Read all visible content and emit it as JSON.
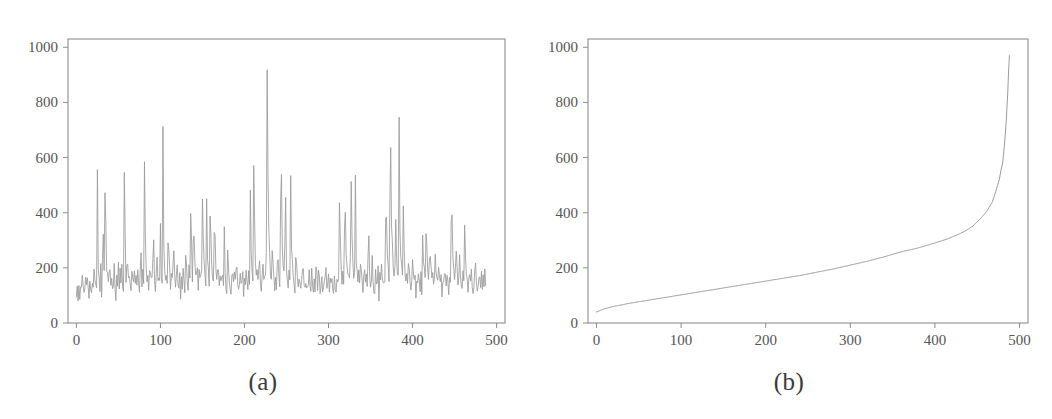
{
  "figure": {
    "background_color": "#ffffff",
    "line_color": "#9a9a9a",
    "axis_color": "#8e8e8e",
    "tick_label_color": "#555555",
    "caption_color": "#3a3a3a"
  },
  "panels": [
    {
      "id": "a",
      "caption": "(a)"
    },
    {
      "id": "b",
      "caption": "(b)"
    }
  ],
  "chart_data": [
    {
      "type": "line",
      "panel": "(a)",
      "title": "",
      "xlabel": "",
      "ylabel": "",
      "xlim": [
        -10,
        510
      ],
      "ylim": [
        0,
        1030
      ],
      "xticks": [
        0,
        100,
        200,
        300,
        400,
        500
      ],
      "yticks": [
        0,
        200,
        400,
        600,
        800,
        1000
      ],
      "xtick_labels": [
        "0",
        "100",
        "200",
        "300",
        "400",
        "500"
      ],
      "ytick_labels": [
        "0",
        "200",
        "400",
        "600",
        "800",
        "1000"
      ],
      "grid": false,
      "legend": null,
      "series": [
        {
          "name": "value",
          "note": "unsorted sequence of 488 positive values, noisy baseline near 150-200 with sharp spikes up to ~980",
          "x_start": 0,
          "x_end": 487,
          "values": [
            95,
            112,
            78,
            130,
            88,
            155,
            104,
            168,
            120,
            72,
            140,
            160,
            108,
            185,
            96,
            132,
            150,
            88,
            176,
            112,
            200,
            128,
            158,
            98,
            565,
            190,
            142,
            118,
            205,
            86,
            246,
            322,
            160,
            624,
            214,
            130,
            188,
            102,
            262,
            146,
            178,
            120,
            96,
            210,
            158,
            84,
            170,
            136,
            222,
            108,
            182,
            152,
            240,
            118,
            96,
            676,
            204,
            144,
            268,
            172,
            130,
            210,
            88,
            156,
            196,
            122,
            248,
            102,
            178,
            134,
            214,
            160,
            92,
            188,
            242,
            118,
            206,
            150,
            668,
            232,
            176,
            128,
            196,
            108,
            268,
            154,
            188,
            126,
            364,
            212,
            96,
            176,
            244,
            140,
            200,
            118,
            382,
            168,
            132,
            724,
            262,
            200,
            148,
            186,
            110,
            352,
            226,
            168,
            128,
            208,
            96,
            318,
            180,
            146,
            112,
            238,
            160,
            122,
            196,
            88,
            172,
            134,
            208,
            152,
            118,
            264,
            186,
            142,
            108,
            224,
            168,
            498,
            196,
            150,
            412,
            232,
            178,
            120,
            262,
            104,
            188,
            148,
            206,
            128,
            472,
            318,
            246,
            188,
            152,
            466,
            208,
            174,
            130,
            454,
            286,
            196,
            164,
            126,
            462,
            204,
            168,
            132,
            248,
            110,
            188,
            150,
            122,
            206,
            86,
            376,
            172,
            138,
            104,
            268,
            196,
            158,
            124,
            90,
            212,
            168,
            134,
            190,
            106,
            248,
            176,
            142,
            112,
            206,
            162,
            128,
            196,
            84,
            172,
            140,
            214,
            158,
            118,
            188,
            150,
            510,
            222,
            178,
            132,
            704,
            264,
            202,
            158,
            196,
            120,
            296,
            182,
            146,
            118,
            238,
            170,
            132,
            206,
            94,
            980,
            552,
            318,
            240,
            186,
            150,
            286,
            202,
            164,
            128,
            196,
            110,
            268,
            184,
            146,
            118,
            742,
            320,
            246,
            192,
            156,
            552,
            214,
            176,
            134,
            198,
            118,
            548,
            286,
            224,
            180,
            148,
            112,
            244,
            196,
            160,
            128,
            206,
            88,
            172,
            140,
            212,
            158,
            120,
            186,
            98,
            164,
            132,
            198,
            152,
            116,
            180,
            144,
            108,
            172,
            92,
            204,
            162,
            126,
            188,
            150,
            114,
            176,
            138,
            102,
            168,
            130,
            196,
            154,
            118,
            182,
            96,
            158,
            124,
            190,
            146,
            110,
            174,
            136,
            100,
            166,
            128,
            192,
            502,
            248,
            186,
            150,
            206,
            118,
            524,
            286,
            220,
            176,
            140,
            196,
            110,
            578,
            310,
            238,
            184,
            148,
            552,
            212,
            170,
            132,
            196,
            114,
            262,
            188,
            150,
            118,
            232,
            170,
            134,
            202,
            96,
            412,
            186,
            148,
            116,
            242,
            176,
            138,
            106,
            198,
            160,
            124,
            188,
            84,
            170,
            132,
            206,
            152,
            118,
            186,
            100,
            532,
            286,
            224,
            178,
            142,
            814,
            380,
            292,
            236,
            186,
            150,
            408,
            220,
            176,
            138,
            754,
            326,
            248,
            196,
            158,
            482,
            212,
            172,
            132,
            200,
            116,
            264,
            188,
            148,
            120,
            236,
            174,
            136,
            204,
            94,
            168,
            130,
            196,
            154,
            118,
            184,
            98,
            320,
            226,
            180,
            144,
            378,
            248,
            190,
            152,
            290,
            208,
            168,
            130,
            196,
            112,
            248,
            186,
            148,
            118,
            230,
            172,
            134,
            200,
            90,
            166,
            128,
            192,
            152,
            116,
            180,
            142,
            106,
            168,
            130,
            528,
            286,
            226,
            180,
            144,
            276,
            210,
            170,
            132,
            248,
            196,
            158,
            124,
            188,
            150,
            360,
            232,
            186,
            148,
            112,
            196,
            168,
            130,
            206,
            118,
            96,
            152,
            240,
            184,
            146,
            116,
            198,
            160,
            124,
            188,
            108,
            172,
            136,
            200,
            154
          ]
        }
      ]
    },
    {
      "type": "line",
      "panel": "(b)",
      "title": "",
      "xlabel": "",
      "ylabel": "",
      "xlim": [
        -10,
        510
      ],
      "ylim": [
        0,
        1030
      ],
      "xticks": [
        0,
        100,
        200,
        300,
        400,
        500
      ],
      "yticks": [
        0,
        200,
        400,
        600,
        800,
        1000
      ],
      "xtick_labels": [
        "0",
        "100",
        "200",
        "300",
        "400",
        "500"
      ],
      "ytick_labels": [
        "0",
        "200",
        "400",
        "600",
        "800",
        "1000"
      ],
      "grid": false,
      "legend": null,
      "series": [
        {
          "name": "sorted value",
          "note": "the same 488 values sorted ascending; starts near 40, gently rises to ~300 by x=420, then climbs steeply to ~970 at x=488",
          "x_start": 0,
          "x_end": 487,
          "control_points": [
            [
              0,
              40
            ],
            [
              10,
              52
            ],
            [
              20,
              60
            ],
            [
              40,
              72
            ],
            [
              60,
              82
            ],
            [
              80,
              92
            ],
            [
              100,
              102
            ],
            [
              120,
              112
            ],
            [
              140,
              122
            ],
            [
              160,
              132
            ],
            [
              180,
              142
            ],
            [
              200,
              152
            ],
            [
              220,
              162
            ],
            [
              240,
              172
            ],
            [
              260,
              184
            ],
            [
              280,
              196
            ],
            [
              300,
              210
            ],
            [
              320,
              224
            ],
            [
              340,
              240
            ],
            [
              360,
              258
            ],
            [
              380,
              272
            ],
            [
              400,
              290
            ],
            [
              415,
              305
            ],
            [
              425,
              318
            ],
            [
              435,
              332
            ],
            [
              445,
              352
            ],
            [
              455,
              382
            ],
            [
              462,
              408
            ],
            [
              468,
              440
            ],
            [
              472,
              478
            ],
            [
              476,
              520
            ],
            [
              478,
              552
            ],
            [
              480,
              580
            ],
            [
              482,
              640
            ],
            [
              484,
              720
            ],
            [
              486,
              830
            ],
            [
              487,
              910
            ],
            [
              488,
              970
            ]
          ]
        }
      ]
    }
  ]
}
